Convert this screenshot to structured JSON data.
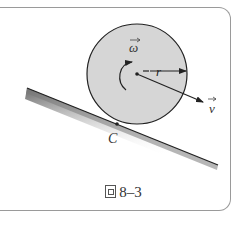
{
  "figure": {
    "caption_prefix": "图",
    "caption_number": "8–3",
    "labels": {
      "omega": "ω",
      "radius": "r",
      "velocity": "v",
      "contact_point": "C"
    },
    "colors": {
      "disk_fill": "#d6d6d6",
      "outline": "#222222",
      "frame": "#9a9a9a"
    }
  }
}
